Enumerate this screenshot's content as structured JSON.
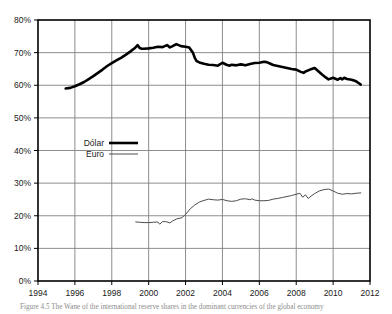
{
  "chart_data": {
    "type": "line",
    "title": "",
    "xlabel": "",
    "ylabel": "",
    "xlim": [
      1994,
      2012
    ],
    "ylim": [
      0,
      80
    ],
    "grid": true,
    "legend_position": "inside-left-middle",
    "x_ticks": [
      "1994",
      "1996",
      "1998",
      "2000",
      "2002",
      "2004",
      "2006",
      "2008",
      "2010",
      "2012"
    ],
    "x_tick_values": [
      1994,
      1996,
      1998,
      2000,
      2002,
      2004,
      2006,
      2008,
      2010,
      2012
    ],
    "y_ticks": [
      "0%",
      "10%",
      "20%",
      "30%",
      "40%",
      "50%",
      "60%",
      "70%",
      "80%"
    ],
    "y_tick_values": [
      0,
      10,
      20,
      30,
      40,
      50,
      60,
      70,
      80
    ],
    "series": [
      {
        "name": "Dólar",
        "color": "#000000",
        "width": 2.6,
        "x": [
          1995.5,
          1995.75,
          1996.0,
          1996.25,
          1996.5,
          1996.75,
          1997.0,
          1997.25,
          1997.5,
          1997.75,
          1998.0,
          1998.25,
          1998.5,
          1998.75,
          1999.0,
          1999.25,
          1999.4,
          1999.5,
          1999.6,
          1999.75,
          2000.0,
          2000.25,
          2000.5,
          2000.75,
          2001.0,
          2001.15,
          2001.3,
          2001.5,
          2001.75,
          2002.0,
          2002.2,
          2002.4,
          2002.5,
          2002.6,
          2002.75,
          2003.0,
          2003.25,
          2003.5,
          2003.75,
          2004.0,
          2004.25,
          2004.4,
          2004.5,
          2004.75,
          2005.0,
          2005.25,
          2005.5,
          2005.75,
          2006.0,
          2006.25,
          2006.4,
          2006.6,
          2006.75,
          2007.0,
          2007.25,
          2007.5,
          2007.75,
          2008.0,
          2008.25,
          2008.4,
          2008.5,
          2008.75,
          2009.0,
          2009.2,
          2009.4,
          2009.6,
          2009.75,
          2010.0,
          2010.25,
          2010.4,
          2010.5,
          2010.6,
          2010.75,
          2011.0,
          2011.25,
          2011.4,
          2011.5
        ],
        "y": [
          59.0,
          59.2,
          59.7,
          60.3,
          61.0,
          61.9,
          62.8,
          63.8,
          64.8,
          65.9,
          66.8,
          67.6,
          68.4,
          69.3,
          70.3,
          71.4,
          72.3,
          71.5,
          71.2,
          71.2,
          71.3,
          71.5,
          71.8,
          71.7,
          72.3,
          71.6,
          72.0,
          72.6,
          72.0,
          71.8,
          71.6,
          70.0,
          68.4,
          67.4,
          67.0,
          66.6,
          66.3,
          66.2,
          66.0,
          66.9,
          66.2,
          66.0,
          66.3,
          66.1,
          66.4,
          66.1,
          66.5,
          66.8,
          66.9,
          67.2,
          67.1,
          66.6,
          66.2,
          65.9,
          65.6,
          65.3,
          65.0,
          64.8,
          64.1,
          63.8,
          64.2,
          64.8,
          65.3,
          64.3,
          63.3,
          62.4,
          61.8,
          62.3,
          61.7,
          62.2,
          61.8,
          62.3,
          61.9,
          61.7,
          61.2,
          60.6,
          60.2
        ]
      },
      {
        "name": "Euro",
        "color": "#4d4d4d",
        "width": 1.0,
        "x": [
          1999.3,
          1999.5,
          1999.75,
          2000.0,
          2000.25,
          2000.5,
          2000.6,
          2000.75,
          2000.9,
          2001.0,
          2001.15,
          2001.3,
          2001.5,
          2001.65,
          2001.8,
          2002.0,
          2002.25,
          2002.5,
          2002.75,
          2003.0,
          2003.25,
          2003.5,
          2003.75,
          2004.0,
          2004.25,
          2004.5,
          2004.75,
          2005.0,
          2005.25,
          2005.5,
          2005.6,
          2005.75,
          2006.0,
          2006.25,
          2006.5,
          2006.75,
          2007.0,
          2007.25,
          2007.5,
          2007.75,
          2008.0,
          2008.2,
          2008.35,
          2008.5,
          2008.65,
          2008.8,
          2009.0,
          2009.25,
          2009.5,
          2009.75,
          2010.0,
          2010.25,
          2010.5,
          2010.75,
          2011.0,
          2011.25,
          2011.5
        ],
        "y": [
          18.1,
          18.0,
          17.9,
          17.9,
          18.0,
          18.1,
          17.4,
          18.2,
          18.2,
          18.1,
          17.8,
          18.4,
          19.0,
          19.2,
          19.4,
          20.4,
          22.1,
          23.3,
          24.2,
          24.7,
          25.1,
          24.9,
          24.8,
          25.0,
          24.6,
          24.4,
          24.6,
          25.1,
          25.2,
          24.9,
          25.2,
          24.8,
          24.6,
          24.6,
          24.7,
          25.1,
          25.3,
          25.6,
          25.9,
          26.2,
          26.6,
          26.9,
          25.7,
          26.4,
          25.3,
          26.0,
          26.8,
          27.6,
          28.0,
          28.2,
          27.6,
          26.9,
          26.6,
          26.8,
          26.7,
          26.9,
          27.0
        ]
      }
    ]
  },
  "legend": {
    "items": [
      {
        "label": "Dólar",
        "style": "thick-black-line"
      },
      {
        "label": "Euro",
        "style": "thin-gray-line"
      }
    ]
  },
  "caption": {
    "text": "Figure 4.5 The Wane of the international reserve shares in the dominant currencies of the global economy"
  }
}
